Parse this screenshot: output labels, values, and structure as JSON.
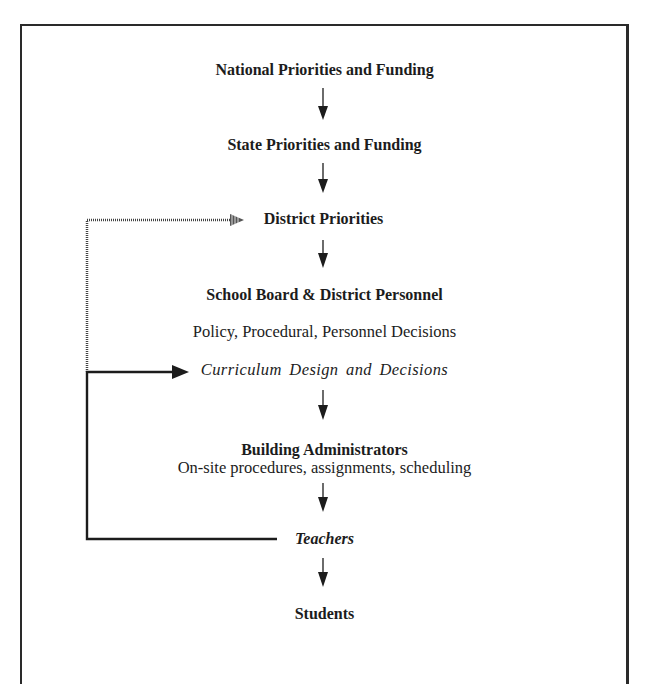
{
  "diagram": {
    "nodes": [
      {
        "id": "national",
        "label": "National Priorities and Funding",
        "style": "bold"
      },
      {
        "id": "state",
        "label": "State Priorities and Funding",
        "style": "bold"
      },
      {
        "id": "district",
        "label": "District Priorities",
        "style": "bold"
      },
      {
        "id": "school_board",
        "label": "School Board & District Personnel",
        "style": "bold"
      },
      {
        "id": "policy",
        "label": "Policy, Procedural, Personnel Decisions",
        "style": "regular"
      },
      {
        "id": "curriculum",
        "label": "Curriculum Design and Decisions",
        "style": "italic"
      },
      {
        "id": "building_admin",
        "label": "Building Administrators",
        "style": "bold"
      },
      {
        "id": "onsite",
        "label": "On-site procedures, assignments, scheduling",
        "style": "regular"
      },
      {
        "id": "teachers",
        "label": "Teachers",
        "style": "bold-italic"
      },
      {
        "id": "students",
        "label": "Students",
        "style": "bold"
      }
    ],
    "edges": [
      {
        "from": "national",
        "to": "state",
        "type": "solid-arrow"
      },
      {
        "from": "state",
        "to": "district",
        "type": "solid-arrow"
      },
      {
        "from": "district",
        "to": "school_board",
        "type": "solid-arrow"
      },
      {
        "from": "curriculum",
        "to": "building_admin",
        "type": "solid-arrow"
      },
      {
        "from": "building_admin",
        "to": "teachers",
        "type": "solid-arrow"
      },
      {
        "from": "teachers",
        "to": "students",
        "type": "solid-arrow"
      },
      {
        "from": "teachers",
        "to": "curriculum",
        "type": "solid-feedback-arrow"
      },
      {
        "from": "teachers",
        "to": "district",
        "type": "dotted-feedback-arrow"
      }
    ],
    "colors": {
      "ink": "#1c1c1c",
      "background": "#ffffff"
    }
  }
}
